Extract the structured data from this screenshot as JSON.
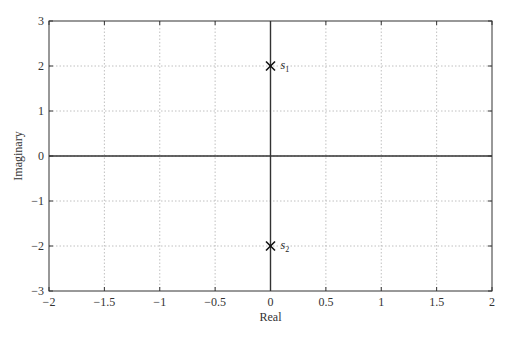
{
  "chart_data": {
    "type": "scatter",
    "title": "",
    "xlabel": "Real",
    "ylabel": "Imaginary",
    "xlim": [
      -2,
      2
    ],
    "ylim": [
      -3,
      3
    ],
    "xticks": [
      -2,
      -1.5,
      -1,
      -0.5,
      0,
      0.5,
      1,
      1.5,
      2
    ],
    "xtick_labels": [
      "−2",
      "−1.5",
      "−1",
      "−0.5",
      "0",
      "0.5",
      "1",
      "1.5",
      "2"
    ],
    "yticks": [
      -3,
      -2,
      -1,
      0,
      1,
      2,
      3
    ],
    "ytick_labels": [
      "−3",
      "−2",
      "−1",
      "0",
      "1",
      "2",
      "3"
    ],
    "grid": true,
    "grid_style": "dotted",
    "marker": "x",
    "series": [
      {
        "name": "poles",
        "points": [
          {
            "x": 0,
            "y": 2,
            "label": "s",
            "subscript": "1"
          },
          {
            "x": 0,
            "y": -2,
            "label": "s",
            "subscript": "2"
          }
        ]
      }
    ],
    "reference_lines": [
      {
        "orientation": "horizontal",
        "value": 0
      },
      {
        "orientation": "vertical",
        "value": 0
      }
    ]
  },
  "colors": {
    "axis": "#333333",
    "grid": "#b0b0b0",
    "marker": "#111111"
  }
}
